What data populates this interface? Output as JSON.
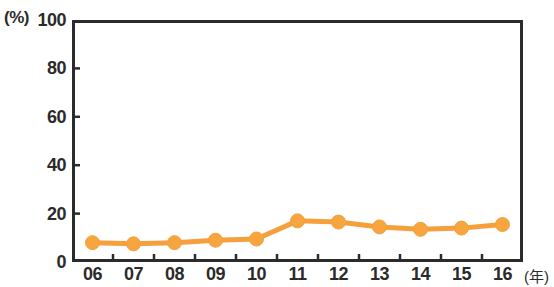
{
  "chart_data": {
    "type": "line",
    "title": "",
    "subtitle": "",
    "xlabel": "(年)",
    "ylabel": "(%)",
    "categories": [
      "06",
      "07",
      "08",
      "09",
      "10",
      "11",
      "12",
      "13",
      "14",
      "15",
      "16"
    ],
    "values": [
      8,
      7.5,
      8,
      9,
      9.5,
      17,
      16.5,
      14.5,
      13.5,
      14,
      15.5
    ],
    "series": [
      {
        "name": "",
        "values": [
          8,
          7.5,
          8,
          9,
          9.5,
          17,
          16.5,
          14.5,
          13.5,
          14,
          15.5
        ]
      }
    ],
    "ylim": [
      0,
      100
    ],
    "y_ticks": [
      0,
      20,
      40,
      60,
      80,
      100
    ],
    "y_tick_labels": [
      "0",
      "20",
      "40",
      "60",
      "80",
      "100"
    ],
    "x_tick_labels": [
      "06",
      "07",
      "08",
      "09",
      "10",
      "11",
      "12",
      "13",
      "14",
      "15",
      "16"
    ],
    "grid": false,
    "legend": "none",
    "annotations": [],
    "marker": "circle",
    "colors": {
      "line": "#f5a03c",
      "marker_fill": "#f7a53f",
      "marker_edge": "#f5a03c",
      "axis": "#2b2b2b",
      "text": "#2b2b2b",
      "background": "#ffffff"
    }
  },
  "axes": {
    "y_unit_label": "(%)",
    "x_unit_label": "(年)"
  }
}
